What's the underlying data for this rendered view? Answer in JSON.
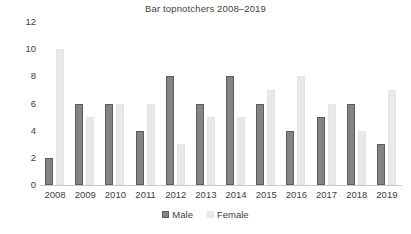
{
  "chart_data": {
    "type": "bar",
    "title": "Bar topnotchers 2008–2019",
    "xlabel": "",
    "ylabel": "",
    "ylim": [
      0,
      12
    ],
    "yticks": [
      0,
      2,
      4,
      6,
      8,
      10,
      12
    ],
    "grid": false,
    "legend_position": "bottom",
    "categories": [
      "2008",
      "2009",
      "2010",
      "2011",
      "2012",
      "2013",
      "2014",
      "2015",
      "2016",
      "2017",
      "2018",
      "2019"
    ],
    "series": [
      {
        "name": "Male",
        "color": "#848484",
        "values": [
          2,
          6,
          6,
          4,
          8,
          6,
          8,
          6,
          4,
          5,
          6,
          3
        ]
      },
      {
        "name": "Female",
        "color": "#e9e9e9",
        "values": [
          10,
          5,
          6,
          6,
          3,
          5,
          5,
          7,
          8,
          6,
          4,
          7
        ]
      }
    ]
  }
}
